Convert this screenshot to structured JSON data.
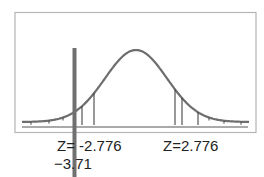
{
  "chart_data": {
    "type": "line",
    "title": "",
    "xlabel": "",
    "ylabel": "",
    "grid": false,
    "critical_values": [
      -2.776,
      2.776
    ],
    "test_statistic": -3.71,
    "labels": {
      "left_critical": "Z= -2.776",
      "right_critical": "Z=2.776",
      "test_stat": "−3.71"
    },
    "colors": {
      "curve": "#6e6e6e",
      "marker": "#707070",
      "frame": "#b0b0b0",
      "lines": "#333333"
    }
  }
}
